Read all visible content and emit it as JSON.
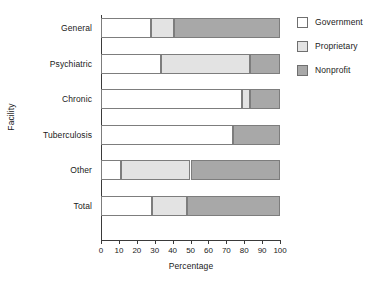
{
  "chart_data": {
    "type": "bar",
    "orientation": "horizontal",
    "stacked": true,
    "title": "",
    "xlabel": "Percentage",
    "ylabel": "Facility",
    "xlim": [
      0,
      100
    ],
    "xticks": [
      0,
      10,
      20,
      30,
      40,
      50,
      60,
      70,
      80,
      90,
      100
    ],
    "xticklabels": [
      "0",
      "10",
      "20",
      "30",
      "40",
      "50",
      "60",
      "70",
      "80",
      "90",
      "100"
    ],
    "grid": false,
    "legend_position": "right",
    "categories": [
      "General",
      "Psychiatric",
      "Chronic",
      "Tuberculosis",
      "Other",
      "Total"
    ],
    "series": [
      {
        "name": "Government",
        "color": "#ffffff",
        "values": [
          28,
          33.5,
          79,
          74,
          11,
          28.5
        ]
      },
      {
        "name": "Proprietary",
        "color": "#e3e3e3",
        "values": [
          13,
          49.5,
          4,
          0,
          39,
          19.5
        ]
      },
      {
        "name": "Nonprofit",
        "color": "#a8a8a8",
        "values": [
          59,
          17,
          17,
          26,
          50,
          52
        ]
      }
    ]
  },
  "legend": {
    "items": [
      {
        "label": "Government",
        "swatch": "#ffffff"
      },
      {
        "label": "Proprietary",
        "swatch": "#e3e3e3"
      },
      {
        "label": "Nonprofit",
        "swatch": "#a8a8a8"
      }
    ]
  },
  "colors": {
    "government": "#ffffff",
    "proprietary": "#e3e3e3",
    "nonprofit": "#a8a8a8",
    "axis": "#3a3a3a",
    "bar_outline": "#7d7d7d",
    "background": "#ffffff"
  }
}
